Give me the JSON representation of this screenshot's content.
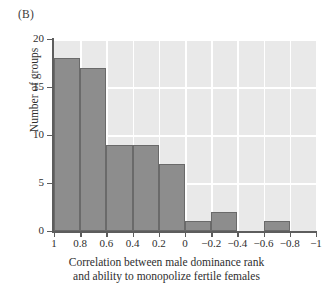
{
  "panel": {
    "label": "(B)"
  },
  "chart_data": {
    "type": "bar",
    "title": "",
    "subtitle": "",
    "panel_label": "(B)",
    "xlabel_line1": "Correlation between male dominance rank",
    "xlabel_line2": "and ability to monopolize fertile females",
    "ylabel": "Number of groups",
    "xlim": [
      1,
      -1
    ],
    "ylim": [
      0,
      20
    ],
    "x_axis_inverted": true,
    "grid": true,
    "grid_color": "#ffffff",
    "plot_background": "#e9e9e9",
    "bar_color": "#8d8d8d",
    "bar_edge_color": "#6a6a6a",
    "legend": null,
    "xticks": [
      1,
      0.8,
      0.6,
      0.4,
      0.2,
      0,
      -0.2,
      -0.4,
      -0.6,
      -0.8,
      -1
    ],
    "xtick_labels": [
      "1",
      "0.8",
      "0.6",
      "0.4",
      "0.2",
      "0",
      "−0.2",
      "−0.4",
      "−0.6",
      "−0.8",
      "−1"
    ],
    "yticks": [
      0,
      5,
      10,
      15,
      20
    ],
    "ytick_labels": [
      "0",
      "5",
      "10",
      "15",
      "20"
    ],
    "bin_edges": [
      1,
      0.8,
      0.6,
      0.4,
      0.2,
      0,
      -0.2,
      -0.4,
      -0.6,
      -0.8,
      -1
    ],
    "categories": [
      "1 to 0.8",
      "0.8 to 0.6",
      "0.6 to 0.4",
      "0.4 to 0.2",
      "0.2 to 0",
      "0 to -0.2",
      "-0.2 to -0.4",
      "-0.4 to -0.6",
      "-0.6 to -0.8",
      "-0.8 to -1"
    ],
    "values": [
      18,
      17,
      9,
      9,
      7,
      1,
      2,
      0,
      1,
      0
    ],
    "bars": [
      {
        "bin_start": 1,
        "bin_end": 0.8,
        "value": 18
      },
      {
        "bin_start": 0.8,
        "bin_end": 0.6,
        "value": 17
      },
      {
        "bin_start": 0.6,
        "bin_end": 0.4,
        "value": 9
      },
      {
        "bin_start": 0.4,
        "bin_end": 0.2,
        "value": 9
      },
      {
        "bin_start": 0.2,
        "bin_end": 0,
        "value": 7
      },
      {
        "bin_start": 0,
        "bin_end": -0.2,
        "value": 1
      },
      {
        "bin_start": -0.2,
        "bin_end": -0.4,
        "value": 2
      },
      {
        "bin_start": -0.4,
        "bin_end": -0.6,
        "value": 0
      },
      {
        "bin_start": -0.6,
        "bin_end": -0.8,
        "value": 1
      },
      {
        "bin_start": -0.8,
        "bin_end": -1,
        "value": 0
      }
    ]
  }
}
